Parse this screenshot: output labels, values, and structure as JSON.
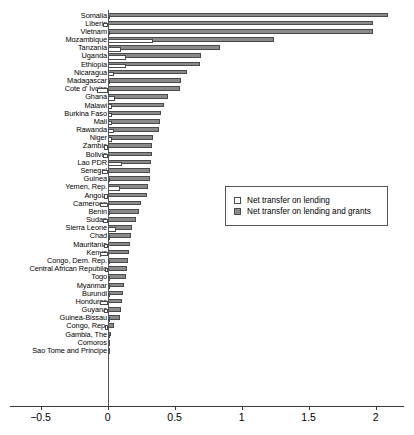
{
  "chart_data": {
    "type": "bar",
    "orientation": "horizontal",
    "title": "",
    "xlabel": "",
    "ylabel": "",
    "xlim": [
      -0.5,
      2.15
    ],
    "xticks": [
      -0.5,
      0,
      0.5,
      1,
      1.5,
      2
    ],
    "xticklabels": [
      "−0.5",
      "0",
      "0.5",
      "1",
      "1.5",
      "2"
    ],
    "grid": false,
    "legend_position": "center-right",
    "categories": [
      "Somalia",
      "Liberia",
      "Vietnam",
      "Mozambique",
      "Tanzania",
      "Uganda",
      "Ethiopia",
      "Nicaragua",
      "Madagascar",
      "Cote d' Ivoire",
      "Ghana",
      "Malawi",
      "Burkina Faso",
      "Mali",
      "Rawanda",
      "Niger",
      "Zambia",
      "Bolivia",
      "Lao PDR",
      "Senegal",
      "Guinea",
      "Yemen, Rep.",
      "Angola",
      "Cameroon",
      "Benin",
      "Sudan",
      "Sierra Leone",
      "Chad",
      "Mauritania",
      "Kenya",
      "Congo, Dem. Rep.",
      "Central African Republic",
      "Togo",
      "Myanmar",
      "Burundi",
      "Honduras",
      "Guyana",
      "Guinea-Bissau",
      "Congo, Rep.",
      "Gambia, The",
      "Comoros",
      "Sao Tome and Principe"
    ],
    "series": [
      {
        "name": "Net transfer on lending",
        "color": "#ffffff",
        "values": [
          0.012,
          -0.035,
          0.0,
          0.34,
          0.1,
          0.14,
          0.14,
          0.05,
          0.0,
          -0.08,
          0.055,
          0.03,
          0.035,
          0.03,
          0.05,
          0.03,
          -0.03,
          -0.035,
          0.11,
          -0.045,
          0.02,
          0.095,
          -0.03,
          -0.06,
          0.0,
          -0.035,
          0.06,
          0.0,
          -0.03,
          -0.055,
          0.0,
          -0.02,
          0.02,
          0.0,
          0.0,
          -0.06,
          -0.03,
          0.0,
          -0.018,
          0.0,
          0.0,
          0.0
        ]
      },
      {
        "name": "Net transfer on lending and grants",
        "color": "#8a8a8a",
        "values": [
          2.09,
          1.98,
          1.98,
          1.24,
          0.84,
          0.7,
          0.69,
          0.59,
          0.545,
          0.54,
          0.45,
          0.42,
          0.395,
          0.39,
          0.385,
          0.34,
          0.33,
          0.33,
          0.325,
          0.32,
          0.315,
          0.3,
          0.295,
          0.25,
          0.235,
          0.215,
          0.185,
          0.175,
          0.165,
          0.16,
          0.15,
          0.148,
          0.135,
          0.12,
          0.115,
          0.105,
          0.1,
          0.095,
          0.048,
          0.022,
          0.016,
          0.014
        ]
      }
    ]
  },
  "legend": {
    "items": [
      {
        "label": "Net transfer on lending"
      },
      {
        "label": "Net transfer on lending and grants"
      }
    ]
  }
}
